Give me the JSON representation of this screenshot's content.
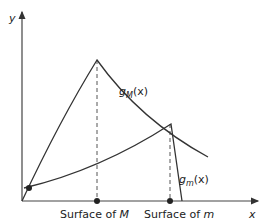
{
  "axes": {
    "x_label": "x",
    "y_label": "y"
  },
  "curves": {
    "gM": {
      "name": "g",
      "sub": "M",
      "arg": "(x)"
    },
    "gm": {
      "name": "g",
      "sub": "m",
      "arg": "(x)"
    }
  },
  "ticks": {
    "surface_M": {
      "prefix": "Surface of ",
      "var": "M"
    },
    "surface_m": {
      "prefix": "Surface of ",
      "var": "m"
    }
  },
  "colors": {
    "line": "#333333",
    "dash": "#555555"
  }
}
